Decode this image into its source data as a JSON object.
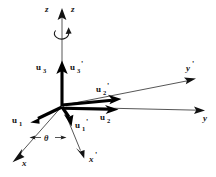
{
  "figure": {
    "background_color": "#ffffff",
    "line_color": "#2b2b2b",
    "vector_color": "#000000",
    "width": 216,
    "height": 177
  },
  "labels": {
    "z_axis": "z",
    "z_prime_axis": "z",
    "y_axis": "y",
    "y_prime_axis": "y",
    "y_prime_mark": "'",
    "x_axis": "x",
    "x_prime_axis": "x",
    "x_prime_mark": "'",
    "u1": "u",
    "u1_sub": "1",
    "u1_prime": "u",
    "u1_prime_sub": "1",
    "u1_prime_mark": "'",
    "u2": "u",
    "u2_sub": "2",
    "u2_prime": "u",
    "u2_prime_sub": "2",
    "u2_prime_mark": "'",
    "u3": "u",
    "u3_sub": "3",
    "u3_prime": "u",
    "u3_prime_sub": "3",
    "u3_prime_mark": "'",
    "theta": "θ"
  },
  "geometry": {
    "origin": {
      "x": 62,
      "y": 106
    },
    "axes": [
      {
        "name": "z-axis",
        "x1": 62,
        "y1": 106,
        "x2": 62,
        "y2": 14,
        "arrow": true
      },
      {
        "name": "y-axis",
        "x1": 62,
        "y1": 106,
        "x2": 203,
        "y2": 110,
        "arrow": true
      },
      {
        "name": "y-prime-axis",
        "x1": 62,
        "y1": 106,
        "x2": 194,
        "y2": 79,
        "arrow": true
      },
      {
        "name": "x-axis",
        "x1": 62,
        "y1": 106,
        "x2": 13,
        "y2": 161,
        "arrow": true
      },
      {
        "name": "x-prime-axis",
        "x1": 62,
        "y1": 106,
        "x2": 84,
        "y2": 157,
        "arrow": true
      }
    ],
    "vectors": [
      {
        "name": "u3",
        "x1": 62,
        "y1": 106,
        "x2": 62,
        "y2": 63,
        "arrow": true
      },
      {
        "name": "u2",
        "x1": 62,
        "y1": 106,
        "x2": 117,
        "y2": 109,
        "arrow": true
      },
      {
        "name": "u2-prime",
        "x1": 62,
        "y1": 106,
        "x2": 120,
        "y2": 100,
        "arrow": true
      },
      {
        "name": "u1",
        "x1": 62,
        "y1": 106,
        "x2": 32,
        "y2": 121,
        "arrow": true
      },
      {
        "name": "u1-prime",
        "x1": 62,
        "y1": 106,
        "x2": 71,
        "y2": 124,
        "arrow": true
      }
    ],
    "rotation_arc": {
      "cx": 62,
      "cy": 33,
      "rx": 7,
      "ry": 5
    },
    "angle_marker": {
      "label_x": 45,
      "label_y": 139,
      "left_tick_x": 29,
      "right_tick_x": 67
    }
  }
}
